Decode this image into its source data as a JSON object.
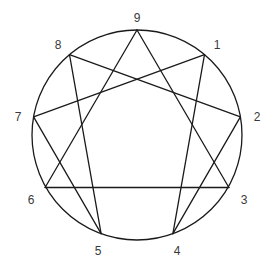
{
  "figure": {
    "name": "enneagram-diagram",
    "background_color": "#ffffff",
    "stroke_color": "#1a1a1a",
    "label_color": "#3a3a3a",
    "stroke_width": 1.3
  },
  "circle": {
    "name": "enneagram-circle",
    "center_x": 137,
    "center_y": 135,
    "radius": 105
  },
  "points": [
    {
      "label": "1",
      "angle_deg": -50,
      "x": 204.5,
      "y": 54.6,
      "label_x": 217,
      "label_y": 46
    },
    {
      "label": "2",
      "angle_deg": -10,
      "x": 240.4,
      "y": 116.8,
      "label_x": 257,
      "label_y": 118
    },
    {
      "label": "3",
      "angle_deg": 30,
      "x": 228.9,
      "y": 187.5,
      "label_x": 244,
      "label_y": 201
    },
    {
      "label": "4",
      "angle_deg": 70,
      "x": 172.9,
      "y": 233.7,
      "label_x": 177,
      "label_y": 252
    },
    {
      "label": "5",
      "angle_deg": 110,
      "x": 101.1,
      "y": 233.7,
      "label_x": 98,
      "label_y": 252
    },
    {
      "label": "6",
      "angle_deg": 150,
      "x": 45.1,
      "y": 187.5,
      "label_x": 31,
      "label_y": 201
    },
    {
      "label": "7",
      "angle_deg": 190,
      "x": 33.6,
      "y": 116.8,
      "label_x": 18,
      "label_y": 118
    },
    {
      "label": "8",
      "angle_deg": 230,
      "x": 69.5,
      "y": 54.6,
      "label_x": 58,
      "label_y": 46
    },
    {
      "label": "9",
      "angle_deg": 270,
      "x": 137,
      "y": 30,
      "label_x": 137,
      "label_y": 19
    }
  ],
  "triangle": {
    "name": "enneagram-triangle",
    "sequence": [
      "9",
      "3",
      "6"
    ],
    "closed": true
  },
  "hexad": {
    "name": "enneagram-hexad",
    "sequence": [
      "1",
      "4",
      "2",
      "8",
      "5",
      "7"
    ],
    "closed": true
  },
  "chart_data": {
    "type": "diagram",
    "shape": "circle with inscribed equilateral triangle and irregular hexagram",
    "nodes": [
      "1",
      "2",
      "3",
      "4",
      "5",
      "6",
      "7",
      "8",
      "9"
    ],
    "edges": [
      [
        "9",
        "3"
      ],
      [
        "3",
        "6"
      ],
      [
        "6",
        "9"
      ],
      [
        "1",
        "4"
      ],
      [
        "4",
        "2"
      ],
      [
        "2",
        "8"
      ],
      [
        "8",
        "5"
      ],
      [
        "5",
        "7"
      ],
      [
        "7",
        "1"
      ]
    ]
  }
}
